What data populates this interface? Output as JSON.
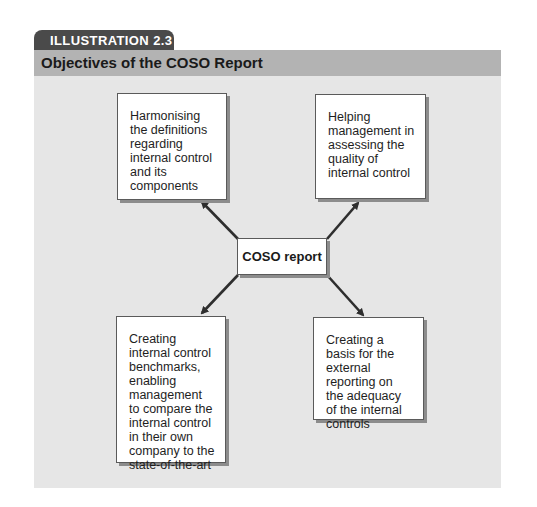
{
  "illustration": {
    "label": "ILLUSTRATION 2.3",
    "title": "Objectives of the COSO Report"
  },
  "diagram": {
    "center": {
      "label": "COSO report"
    },
    "objectives": [
      {
        "position": "top-left",
        "text": "Harmonising the definitions regarding internal control and its components"
      },
      {
        "position": "top-right",
        "text": "Helping management in assessing the quality of internal control"
      },
      {
        "position": "bottom-left",
        "text": "Creating internal control benchmarks, enabling management to compare the internal control in their own company to the state-of-the-art"
      },
      {
        "position": "bottom-right",
        "text": "Creating a basis for the external reporting on the adequacy of the internal controls"
      }
    ],
    "edges": [
      {
        "from": "COSO report",
        "to": "top-left"
      },
      {
        "from": "COSO report",
        "to": "top-right"
      },
      {
        "from": "COSO report",
        "to": "bottom-left"
      },
      {
        "from": "COSO report",
        "to": "bottom-right"
      }
    ],
    "colors": {
      "tab": "#4a4a4a",
      "title_band": "#b3b3b3",
      "panel": "#e6e6e6",
      "box": "#ffffff",
      "arrow": "#2e2e2e"
    }
  }
}
